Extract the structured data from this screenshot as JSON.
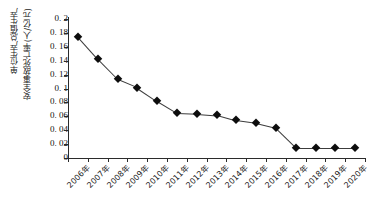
{
  "chart_data": {
    "type": "line",
    "title": "",
    "xlabel": "",
    "ylabel": "单位生产总值生产安全事故死亡率(人/亿元)",
    "ylabel_lines": [
      "单位生产总值生产",
      "安全事故死亡率(人/亿元)"
    ],
    "categories": [
      "2006年",
      "2007年",
      "2008年",
      "2009年",
      "2010年",
      "2011年",
      "2012年",
      "2013年",
      "2014年",
      "2015年",
      "2016年",
      "2017年",
      "2018年",
      "2019年",
      "2020年"
    ],
    "values": [
      0.174,
      0.142,
      0.113,
      0.101,
      0.082,
      0.065,
      0.064,
      0.062,
      0.054,
      0.05,
      0.043,
      0.015,
      0.015,
      0.015,
      0.015
    ],
    "ylim": [
      0,
      0.2
    ],
    "ytick_labels": [
      "0.2",
      "0.18",
      "0.16",
      "0.14",
      "0.12",
      "0.1",
      "0.08",
      "0.06",
      "0.04",
      "0.02",
      "0"
    ],
    "ytick_values": [
      0.2,
      0.18,
      0.16,
      0.14,
      0.12,
      0.1,
      0.08,
      0.06,
      0.04,
      0.02,
      0
    ],
    "grid": false,
    "legend": "none",
    "marker": "diamond",
    "marker_color": "#0d0d0d",
    "line_color": "#3c3c3c",
    "axis_color": "#2b2b2b",
    "background": "#ffffff"
  }
}
